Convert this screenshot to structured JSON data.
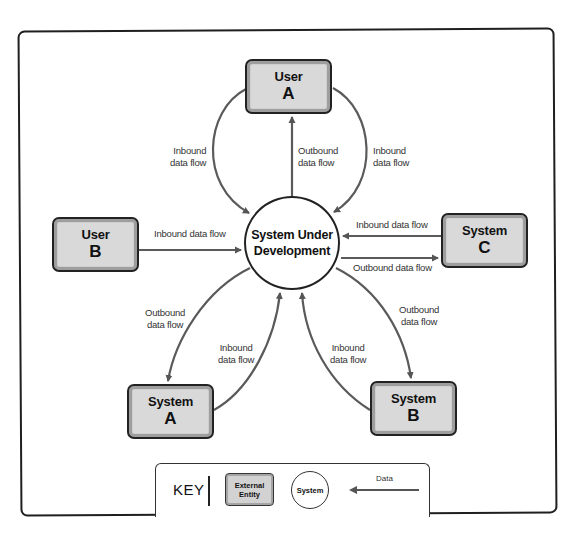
{
  "diagram": {
    "type": "context data flow diagram",
    "center": {
      "label_line1": "System Under",
      "label_line2": "Development"
    },
    "entities": [
      {
        "id": "user-a",
        "line1": "User",
        "line2": "A"
      },
      {
        "id": "user-b",
        "line1": "User",
        "line2": "B"
      },
      {
        "id": "system-c",
        "line1": "System",
        "line2": "C"
      },
      {
        "id": "system-a",
        "line1": "System",
        "line2": "A"
      },
      {
        "id": "system-b",
        "line1": "System",
        "line2": "B"
      }
    ],
    "flows": {
      "user_a_inbound_left": {
        "line1": "Inbound",
        "line2": "data flow"
      },
      "user_a_outbound": {
        "line1": "Outbound",
        "line2": "data flow"
      },
      "user_a_inbound_right": {
        "line1": "Inbound",
        "line2": "data flow"
      },
      "user_b_inbound": {
        "text": "Inbound data flow"
      },
      "system_c_inbound": {
        "text": "Inbound data flow"
      },
      "system_c_outbound": {
        "text": "Outbound data flow"
      },
      "system_a_outbound": {
        "line1": "Outbound",
        "line2": "data flow"
      },
      "system_a_inbound": {
        "line1": "Inbound",
        "line2": "data flow"
      },
      "system_b_inbound": {
        "line1": "Inbound",
        "line2": "data flow"
      },
      "system_b_outbound": {
        "line1": "Outbound",
        "line2": "data flow"
      }
    },
    "key": {
      "title": "KEY",
      "entity_line1": "External",
      "entity_line2": "Entity",
      "system_label": "System",
      "data_label": "Data"
    },
    "colors": {
      "entity_fill": "#d9d9d9",
      "entity_band": "#9e9e9e",
      "border": "#222222",
      "arrow": "#555555",
      "background": "#ffffff"
    }
  }
}
